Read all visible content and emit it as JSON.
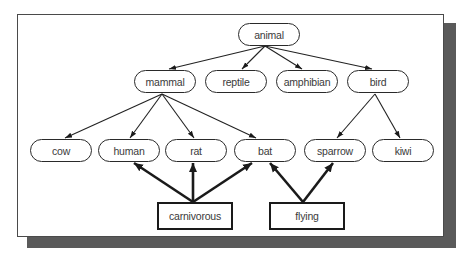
{
  "diagram": {
    "type": "taxonomy-tree-with-property-links",
    "nodes": {
      "animal": {
        "label": "animal",
        "shape": "oval",
        "x": 238,
        "y": 23
      },
      "mammal": {
        "label": "mammal",
        "shape": "oval",
        "x": 134,
        "y": 70
      },
      "reptile": {
        "label": "reptile",
        "shape": "oval",
        "x": 205,
        "y": 70
      },
      "amphibian": {
        "label": "amphibian",
        "shape": "oval",
        "x": 276,
        "y": 70
      },
      "bird": {
        "label": "bird",
        "shape": "oval",
        "x": 347,
        "y": 70
      },
      "cow": {
        "label": "cow",
        "shape": "oval",
        "x": 30,
        "y": 139
      },
      "human": {
        "label": "human",
        "shape": "oval",
        "x": 98,
        "y": 139
      },
      "rat": {
        "label": "rat",
        "shape": "oval",
        "x": 165,
        "y": 139
      },
      "bat": {
        "label": "bat",
        "shape": "oval",
        "x": 234,
        "y": 139
      },
      "sparrow": {
        "label": "sparrow",
        "shape": "oval",
        "x": 304,
        "y": 139
      },
      "kiwi": {
        "label": "kiwi",
        "shape": "oval",
        "x": 372,
        "y": 139
      },
      "carnivorous": {
        "label": "carnivorous",
        "shape": "rect",
        "x": 157,
        "y": 202
      },
      "flying": {
        "label": "flying",
        "shape": "rect",
        "x": 269,
        "y": 202
      }
    },
    "edges": [
      {
        "from": "animal",
        "to": "mammal",
        "style": "thin"
      },
      {
        "from": "animal",
        "to": "reptile",
        "style": "thin"
      },
      {
        "from": "animal",
        "to": "amphibian",
        "style": "thin"
      },
      {
        "from": "animal",
        "to": "bird",
        "style": "thin"
      },
      {
        "from": "mammal",
        "to": "cow",
        "style": "thin"
      },
      {
        "from": "mammal",
        "to": "human",
        "style": "thin"
      },
      {
        "from": "mammal",
        "to": "rat",
        "style": "thin"
      },
      {
        "from": "mammal",
        "to": "bat",
        "style": "thin"
      },
      {
        "from": "bird",
        "to": "sparrow",
        "style": "thin"
      },
      {
        "from": "bird",
        "to": "kiwi",
        "style": "thin"
      },
      {
        "from": "carnivorous",
        "to": "human",
        "style": "bold"
      },
      {
        "from": "carnivorous",
        "to": "rat",
        "style": "bold"
      },
      {
        "from": "carnivorous",
        "to": "bat",
        "style": "bold"
      },
      {
        "from": "flying",
        "to": "bat",
        "style": "bold"
      },
      {
        "from": "flying",
        "to": "sparrow",
        "style": "bold"
      }
    ]
  },
  "colors": {
    "frame_border": "#4a4a4a",
    "shadow": "#5a5a5a",
    "node_border": "#2a2a2a",
    "text": "#3a3a3a",
    "background": "#ffffff"
  }
}
